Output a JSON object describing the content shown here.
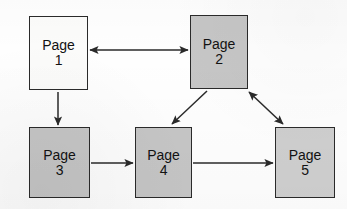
{
  "figure": {
    "kind": "directed-graph",
    "background_color": "#fefefe",
    "line_color": "#2a2a2a"
  },
  "nodes": [
    {
      "id": "page1",
      "name": "Page",
      "number": "1",
      "fill": "#fbfbfa",
      "fill_class": "fill-white",
      "x": 29,
      "y": 16,
      "w": 59,
      "h": 74
    },
    {
      "id": "page2",
      "name": "Page",
      "number": "2",
      "fill": "#c6c6c6",
      "fill_class": "fill-gray",
      "x": 190,
      "y": 15,
      "w": 58,
      "h": 74
    },
    {
      "id": "page3",
      "name": "Page",
      "number": "3",
      "fill": "#c6c6c6",
      "fill_class": "fill-gray",
      "x": 29,
      "y": 127,
      "w": 61,
      "h": 71
    },
    {
      "id": "page4",
      "name": "Page",
      "number": "4",
      "fill": "#c6c6c6",
      "fill_class": "fill-gray",
      "x": 135,
      "y": 127,
      "w": 57,
      "h": 71
    },
    {
      "id": "page5",
      "name": "Page",
      "number": "5",
      "fill": "#cfcfcf",
      "fill_class": "fill-gray2",
      "x": 275,
      "y": 127,
      "w": 60,
      "h": 71
    }
  ],
  "edges": [
    {
      "id": "e1",
      "from": "page1",
      "to": "page2",
      "direction": "bidirectional",
      "label": ""
    },
    {
      "id": "e2",
      "from": "page1",
      "to": "page3",
      "direction": "one-way",
      "label": ""
    },
    {
      "id": "e3",
      "from": "page2",
      "to": "page4",
      "direction": "one-way",
      "label": ""
    },
    {
      "id": "e4",
      "from": "page2",
      "to": "page5",
      "direction": "bidirectional",
      "label": ""
    },
    {
      "id": "e5",
      "from": "page3",
      "to": "page4",
      "direction": "one-way",
      "label": ""
    },
    {
      "id": "e6",
      "from": "page4",
      "to": "page5",
      "direction": "one-way",
      "label": ""
    }
  ]
}
